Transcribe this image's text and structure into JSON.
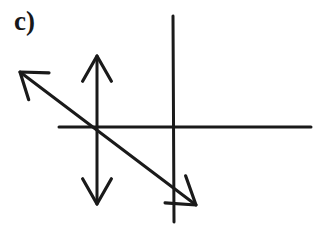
{
  "figure": {
    "panel_label": "c)",
    "background_color": "#ffffff",
    "ink_color": "#1a1a1a",
    "width": 332,
    "height": 230,
    "style": "hand-drawn line diagram, scanned black ink on white paper"
  },
  "chart_data": {
    "type": "diagram",
    "title": "c)",
    "xlabel": "",
    "ylabel": "",
    "grid": false,
    "legend": null,
    "origin": {
      "x": 97,
      "y": 127
    },
    "elements": [
      {
        "name": "horizontal-axis-line",
        "kind": "line",
        "arrowheads": "none",
        "from": {
          "x": 59,
          "y": 127
        },
        "to": {
          "x": 311,
          "y": 127
        },
        "stroke_width": 3
      },
      {
        "name": "secondary-vertical-line",
        "kind": "line",
        "arrowheads": "none",
        "from": {
          "x": 173,
          "y": 16
        },
        "to": {
          "x": 174,
          "y": 222
        },
        "stroke_width": 3
      },
      {
        "name": "vertical-double-arrow",
        "kind": "arrow",
        "arrowheads": "both",
        "from": {
          "x": 97,
          "y": 56
        },
        "to": {
          "x": 97,
          "y": 204
        },
        "stroke_width": 3
      },
      {
        "name": "diagonal-double-arrow",
        "kind": "arrow",
        "arrowheads": "both",
        "from": {
          "x": 20,
          "y": 72
        },
        "to": {
          "x": 196,
          "y": 205
        },
        "stroke_width": 3
      }
    ],
    "annotations": [
      {
        "name": "panel-label",
        "text": "c)",
        "x": 16,
        "y": 15
      }
    ]
  }
}
